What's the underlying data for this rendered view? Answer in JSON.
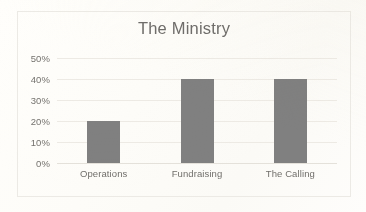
{
  "chart_data": {
    "type": "bar",
    "title": "The Ministry",
    "categories": [
      "Operations",
      "Fundraising",
      "The Calling"
    ],
    "values": [
      20,
      40,
      40
    ],
    "value_suffix": "%",
    "series": [
      {
        "name": "",
        "values": [
          20,
          40,
          40
        ]
      }
    ],
    "xlabel": "",
    "ylabel": "",
    "ylim": [
      0,
      50
    ],
    "ytick_step": 10,
    "ytick_labels": [
      "0%",
      "10%",
      "20%",
      "30%",
      "40%",
      "50%"
    ],
    "ytick_values": [
      0,
      10,
      20,
      30,
      40,
      50
    ],
    "grid": "horizontal",
    "legend": "none",
    "colors": {
      "bar": "#808080",
      "gridline": "#edeae4",
      "title_text": "#6f6d6a",
      "axis_text": "#74726e",
      "frame_border": "#eceae5",
      "background": "#fffefc"
    }
  }
}
